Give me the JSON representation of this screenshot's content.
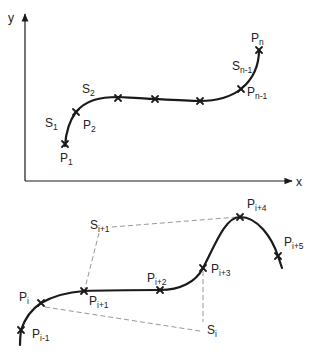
{
  "top_figure": {
    "axes": {
      "x_label": "x",
      "y_label": "y"
    },
    "points": [
      {
        "id": "p1",
        "base": "P",
        "sub": "1",
        "x": 65,
        "y": 144
      },
      {
        "id": "p2",
        "base": "P",
        "sub": "2",
        "x": 76,
        "y": 112
      },
      {
        "id": "p3",
        "x": 118,
        "y": 98
      },
      {
        "id": "p4",
        "x": 155,
        "y": 99
      },
      {
        "id": "p5",
        "x": 200,
        "y": 101
      },
      {
        "id": "pn-1",
        "base": "P",
        "sub": "n-1",
        "x": 241,
        "y": 89
      },
      {
        "id": "pn",
        "base": "P",
        "sub": "n",
        "x": 259,
        "y": 50
      }
    ],
    "labels": {
      "p1": {
        "base": "P",
        "sub": "1"
      },
      "p2": {
        "base": "P",
        "sub": "2"
      },
      "pn_1": {
        "base": "P",
        "sub": "n-1"
      },
      "pn": {
        "base": "P",
        "sub": "n"
      },
      "s1": {
        "base": "S",
        "sub": "1"
      },
      "s2": {
        "base": "S",
        "sub": "2"
      },
      "sn_1": {
        "base": "S",
        "sub": "n-1"
      }
    }
  },
  "bottom_figure": {
    "points": [
      {
        "id": "pi-1",
        "x": 21,
        "y": 330
      },
      {
        "id": "pi",
        "x": 41,
        "y": 303
      },
      {
        "id": "pi+1",
        "x": 84,
        "y": 291
      },
      {
        "id": "pi+2",
        "x": 160,
        "y": 290
      },
      {
        "id": "pi+3",
        "x": 203,
        "y": 268
      },
      {
        "id": "pi+4",
        "x": 240,
        "y": 217
      },
      {
        "id": "pi+5",
        "x": 278,
        "y": 256
      }
    ],
    "labels": {
      "pi_1": {
        "base": "P",
        "sub": "i-1"
      },
      "pi": {
        "base": "P",
        "sub": "i"
      },
      "pi1": {
        "base": "P",
        "sub": "i+1"
      },
      "pi2": {
        "base": "P",
        "sub": "i+2"
      },
      "pi3": {
        "base": "P",
        "sub": "i+3"
      },
      "pi4": {
        "base": "P",
        "sub": "i+4"
      },
      "pi5": {
        "base": "P",
        "sub": "i+5"
      },
      "si": {
        "base": "S",
        "sub": "i"
      },
      "si1": {
        "base": "S",
        "sub": "i+1"
      }
    }
  }
}
